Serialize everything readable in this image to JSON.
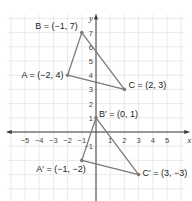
{
  "diagram": {
    "type": "coordinate-plane",
    "x_axis": {
      "name": "x",
      "range": [
        -6,
        6
      ],
      "tick_labels": [
        "-5",
        "-4",
        "-3",
        "-2",
        "-1",
        "1",
        "2",
        "3",
        "4",
        "5"
      ],
      "tick_values": [
        -5,
        -4,
        -3,
        -2,
        -1,
        1,
        2,
        3,
        4,
        5
      ]
    },
    "y_axis": {
      "name": "y",
      "range": [
        -5,
        8
      ],
      "tick_labels": [
        "7",
        "6",
        "5",
        "4",
        "3",
        "2",
        "1",
        "-1"
      ],
      "tick_values": [
        7,
        6,
        5,
        4,
        3,
        2,
        1,
        -1
      ]
    },
    "grid": true,
    "colors": {
      "triangle_stroke": "#7a7a7a",
      "grid": "#e4e4e4",
      "axis": "#3a3a3a"
    },
    "triangles": [
      {
        "name": "ABC",
        "points": [
          {
            "name": "A",
            "prime": false,
            "x": -2,
            "y": 4,
            "label": "A = (−2, 4)",
            "label_side": "left"
          },
          {
            "name": "B",
            "prime": false,
            "x": -1,
            "y": 7,
            "label": "B = (−1, 7)",
            "label_side": "left"
          },
          {
            "name": "C",
            "prime": false,
            "x": 2,
            "y": 3,
            "label": "C = (2, 3)",
            "label_side": "right"
          }
        ]
      },
      {
        "name": "A'B'C'",
        "points": [
          {
            "name": "A'",
            "prime": true,
            "x": -1,
            "y": -2,
            "label": "A′ = (−1, −2)",
            "label_side": "below-left"
          },
          {
            "name": "B'",
            "prime": true,
            "x": 0,
            "y": 1,
            "label": "B′ = (0, 1)",
            "label_side": "right"
          },
          {
            "name": "C'",
            "prime": true,
            "x": 3,
            "y": -3,
            "label": "C′ = (3, −3)",
            "label_side": "right"
          }
        ]
      }
    ]
  }
}
